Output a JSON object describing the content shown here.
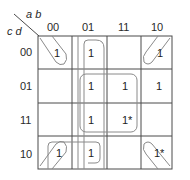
{
  "kmap": {
    "row_var_label": "c d",
    "col_var_label": "a b",
    "col_headers": [
      "00",
      "01",
      "11",
      "10"
    ],
    "row_headers": [
      "00",
      "01",
      "11",
      "10"
    ],
    "cells": [
      [
        "1",
        "1",
        "",
        "1"
      ],
      [
        "",
        "1",
        "1",
        "1"
      ],
      [
        "",
        "1",
        "1*",
        ""
      ],
      [
        "1",
        "1",
        "",
        "1*"
      ]
    ],
    "groups": [
      {
        "name": "column-01-group",
        "cells": "column ab=01, all rows"
      },
      {
        "name": "center-quad-group",
        "cells": "rows 01,11 x cols 01,11"
      },
      {
        "name": "corner-group",
        "cells": "four corners (00,00),(00,10),(10,00),(10,10)"
      },
      {
        "name": "row-10-left-group",
        "cells": "row 10, cols 00,01"
      }
    ],
    "colors": {
      "grid": "#4a4a4a",
      "loop": "#8a8a8a"
    }
  }
}
